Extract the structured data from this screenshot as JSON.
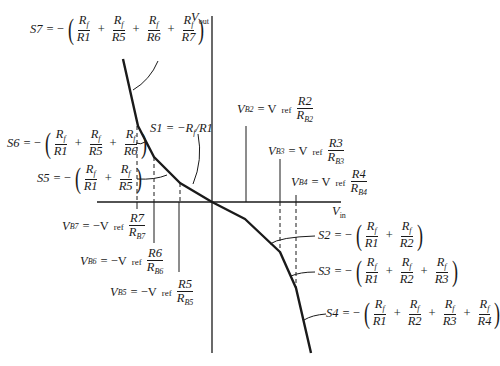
{
  "diagram": {
    "type": "piecewise-linear transfer characteristic",
    "axes": {
      "vertical_label": "V",
      "vertical_sub": "out",
      "horizontal_label": "V",
      "horizontal_sub": "in"
    },
    "curve_points": [
      [
        123,
        59
      ],
      [
        138,
        126
      ],
      [
        154,
        157
      ],
      [
        180,
        183
      ],
      [
        212,
        202
      ],
      [
        245,
        219
      ],
      [
        280,
        252
      ],
      [
        296,
        288
      ],
      [
        311,
        353
      ]
    ],
    "colors": {
      "line": "#1a1a1a",
      "background": "#ffffff"
    }
  },
  "slopes": {
    "s7": {
      "name": "S7",
      "terms": [
        [
          "R",
          "f",
          "R1"
        ],
        [
          "R",
          "f",
          "R5"
        ],
        [
          "R",
          "f",
          "R6"
        ],
        [
          "R",
          "f",
          "R7"
        ]
      ]
    },
    "s6": {
      "name": "S6",
      "terms": [
        [
          "R",
          "f",
          "R1"
        ],
        [
          "R",
          "f",
          "R5"
        ],
        [
          "R",
          "f",
          "R6"
        ]
      ]
    },
    "s5": {
      "name": "S5",
      "terms": [
        [
          "R",
          "f",
          "R1"
        ],
        [
          "R",
          "f",
          "R5"
        ]
      ]
    },
    "s1": {
      "name": "S1",
      "expr": "S1 = −R",
      "sub": "f",
      "tail": "/R1"
    },
    "s2": {
      "name": "S2",
      "terms": [
        [
          "R",
          "f",
          "R1"
        ],
        [
          "R",
          "f",
          "R2"
        ]
      ]
    },
    "s3": {
      "name": "S3",
      "terms": [
        [
          "R",
          "f",
          "R1"
        ],
        [
          "R",
          "f",
          "R2"
        ],
        [
          "R",
          "f",
          "R3"
        ]
      ]
    },
    "s4": {
      "name": "S4",
      "terms": [
        [
          "R",
          "f",
          "R1"
        ],
        [
          "R",
          "f",
          "R2"
        ],
        [
          "R",
          "f",
          "R3"
        ],
        [
          "R",
          "f",
          "R4"
        ]
      ]
    }
  },
  "breakpoints": {
    "vb2": {
      "lhs": "V",
      "lhs_sub": "B2",
      "sign": "= V",
      "ref": "ref",
      "num": "R2",
      "den": "R",
      "den_sub": "B2"
    },
    "vb3": {
      "lhs": "V",
      "lhs_sub": "B3",
      "sign": "= V",
      "ref": "ref",
      "num": "R3",
      "den": "R",
      "den_sub": "B3"
    },
    "vb4": {
      "lhs": "V",
      "lhs_sub": "B4",
      "sign": "= V",
      "ref": "ref",
      "num": "R4",
      "den": "R",
      "den_sub": "B4"
    },
    "vb7": {
      "lhs": "V",
      "lhs_sub": "B7",
      "sign": "= −V",
      "ref": "ref",
      "num": "R7",
      "den": "R",
      "den_sub": "B7"
    },
    "vb6": {
      "lhs": "V",
      "lhs_sub": "B6",
      "sign": "= −V",
      "ref": "ref",
      "num": "R6",
      "den": "R",
      "den_sub": "B6"
    },
    "vb5": {
      "lhs": "V",
      "lhs_sub": "B5",
      "sign": "= −V",
      "ref": "ref",
      "num": "R5",
      "den": "R",
      "den_sub": "B5"
    }
  },
  "symbols": {
    "eq_neg": "= −",
    "plus": "+",
    "open": "(",
    "close": ")"
  }
}
